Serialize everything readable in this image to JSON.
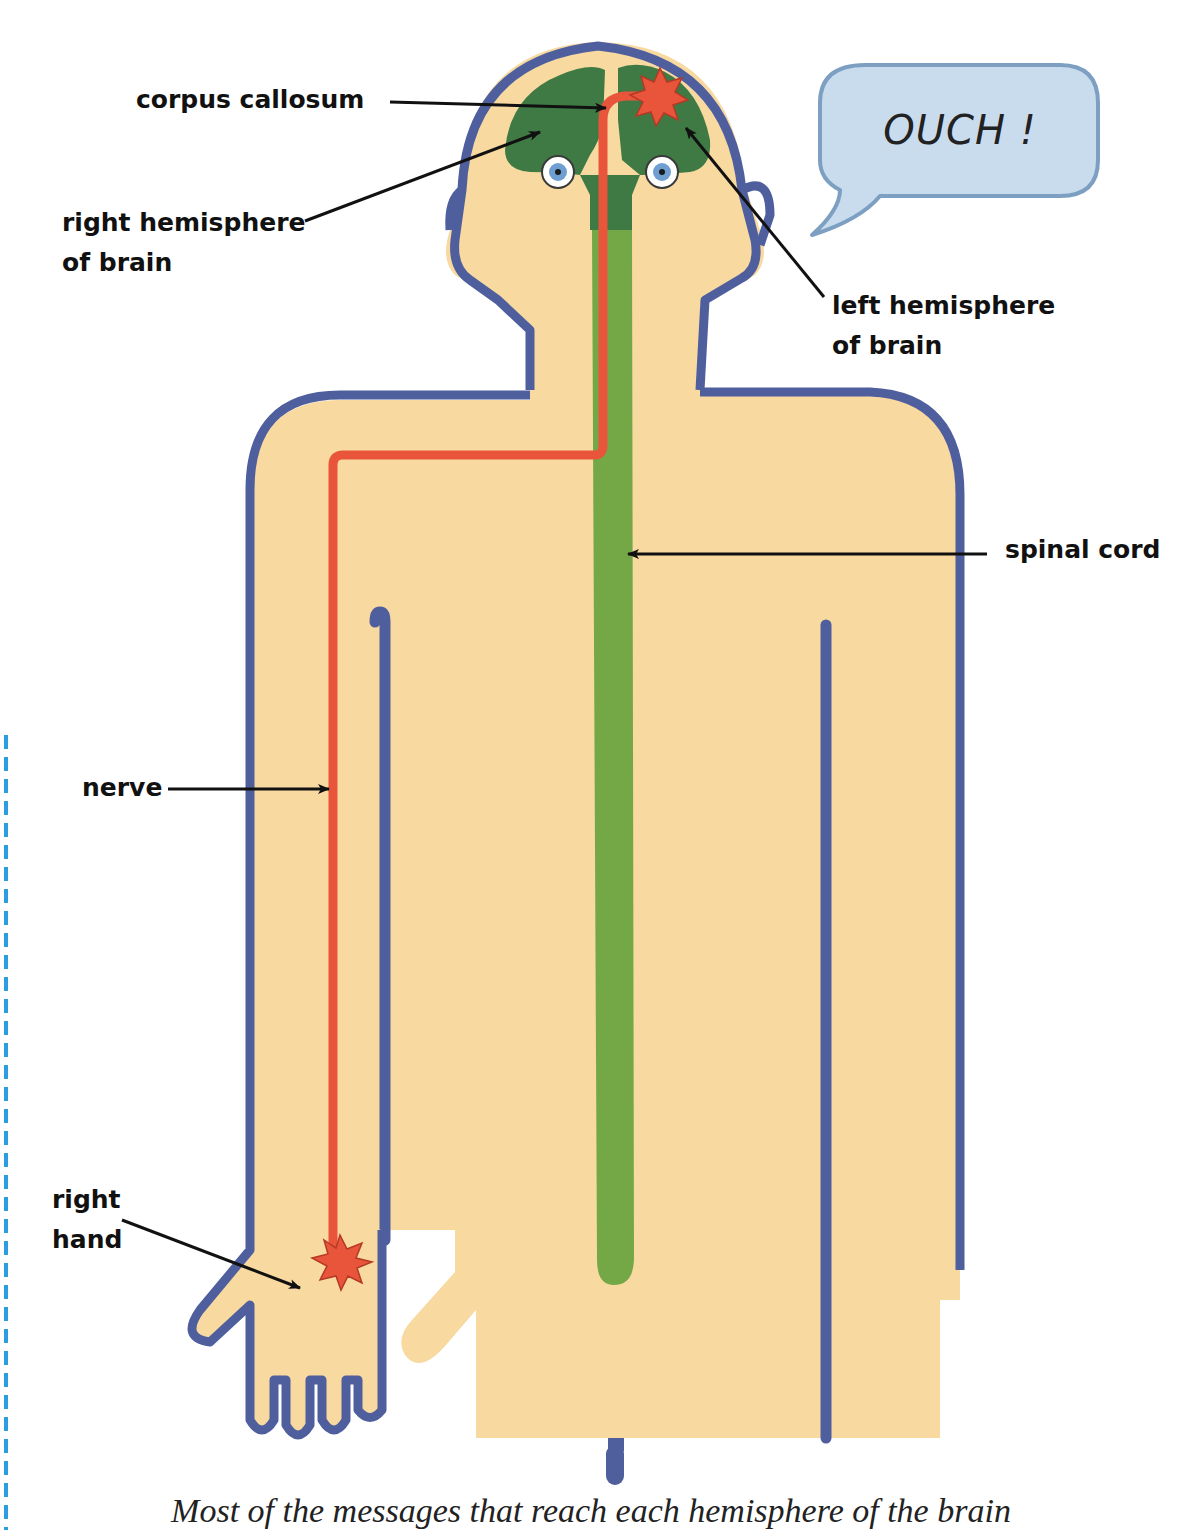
{
  "figure": {
    "speech_bubble": {
      "text": "OUCH !"
    },
    "labels": {
      "corpus_callosum": "corpus callosum",
      "right_hemisphere_line1": "right hemisphere",
      "right_hemisphere_line2": "of brain",
      "left_hemisphere_line1": "left hemisphere",
      "left_hemisphere_line2": "of brain",
      "spinal_cord": "spinal cord",
      "nerve": "nerve",
      "right_hand_line1": "right",
      "right_hand_line2": "hand"
    },
    "caption": "Most of the messages that reach each hemisphere of the brain",
    "colors": {
      "skin": "#f8d9a0",
      "outline": "#4f5f9e",
      "brain": "#3f7a45",
      "spinal_cord": "#74a846",
      "nerve": "#e9553a",
      "eye_iris": "#6f9fd0",
      "bubble_fill": "#c9dcee",
      "bubble_edge": "#7d9fc2",
      "page_margin_guide": "#2a9ee0"
    }
  }
}
